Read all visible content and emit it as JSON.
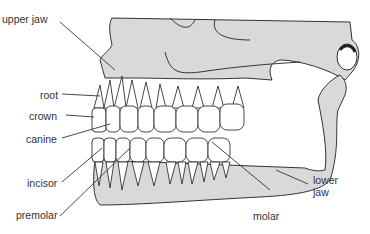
{
  "diagram": {
    "labels": {
      "upper_jaw": "upper jaw",
      "root": "root",
      "crown": "crown",
      "canine": "canine",
      "incisor": "incisor",
      "premolar": "premolar",
      "molar": "molar",
      "lower_jaw_line1": "lower",
      "lower_jaw_line2": "jaw"
    },
    "colors": {
      "bone_fill": "#d9d9d9",
      "outline": "#333333",
      "tooth_fill": "#ffffff",
      "text": "#333333"
    }
  }
}
